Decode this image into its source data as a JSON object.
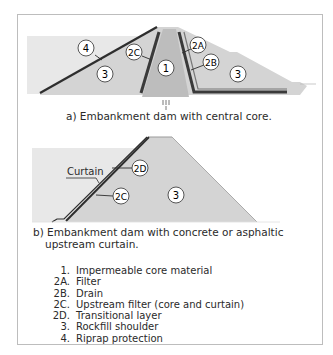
{
  "figure_a": {
    "caption": "a) Embankment dam with central core.",
    "labels": {
      "core": "1",
      "filter": "2A",
      "drain": "2B",
      "upstream_filter": "2C",
      "rockfill_left": "3",
      "rockfill_right": "3",
      "riprap": "4"
    }
  },
  "figure_b": {
    "caption_line1": "b) Embankment dam with concrete or asphaltic",
    "caption_line2": "upstream curtain.",
    "curtain_label": "Curtain",
    "labels": {
      "transitional": "2D",
      "upstream_filter": "2C",
      "rockfill": "3"
    }
  },
  "legend": [
    {
      "key": "1.",
      "text": "Impermeable core material"
    },
    {
      "key": "2A.",
      "text": "Filter"
    },
    {
      "key": "2B.",
      "text": "Drain"
    },
    {
      "key": "2C.",
      "text": "Upstream filter (core and curtain)"
    },
    {
      "key": "2D.",
      "text": "Transitional layer"
    },
    {
      "key": "3.",
      "text": "Rockfill shoulder"
    },
    {
      "key": "4.",
      "text": "Riprap protection"
    }
  ],
  "colors": {
    "water": "#e6e6e6",
    "fill": "#d2d2d2",
    "core": "#bdbdbd",
    "line": "#2e2e2e"
  }
}
